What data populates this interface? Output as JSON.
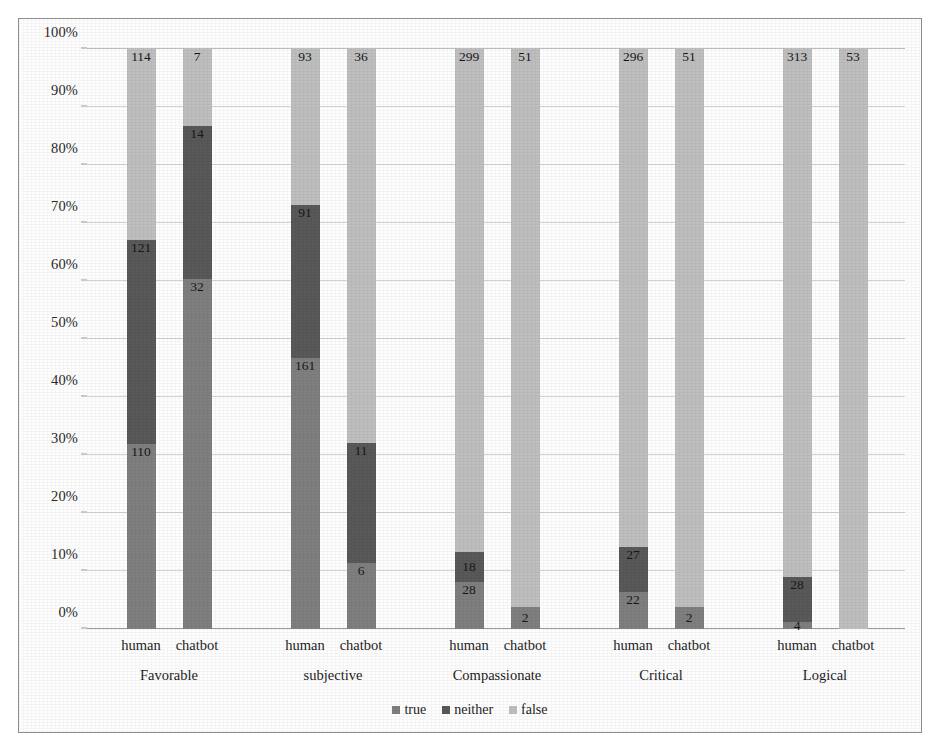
{
  "chart_data": {
    "type": "bar",
    "subtype": "stacked-100-percent",
    "title": "",
    "xlabel": "",
    "ylabel": "",
    "ylim": [
      0,
      100
    ],
    "ytick_labels": [
      "0%",
      "10%",
      "20%",
      "30%",
      "40%",
      "50%",
      "60%",
      "70%",
      "80%",
      "90%",
      "100%"
    ],
    "ytick_values": [
      0,
      10,
      20,
      30,
      40,
      50,
      60,
      70,
      80,
      90,
      100
    ],
    "grid": true,
    "legend_position": "bottom-center",
    "legend": [
      {
        "label": "true",
        "color": "#7f7f7f"
      },
      {
        "label": "neither",
        "color": "#595959"
      },
      {
        "label": "false",
        "color": "#bfbfbf"
      }
    ],
    "categories": [
      "Favorable",
      "subjective",
      "Compassionate",
      "Critical",
      "Logical"
    ],
    "series_labels": [
      "human",
      "chatbot"
    ],
    "bars": [
      {
        "category": "Favorable",
        "series": "human",
        "segments": [
          {
            "name": "true",
            "value": 110,
            "percent": 31.9
          },
          {
            "name": "neither",
            "value": 121,
            "percent": 35.1
          },
          {
            "name": "false",
            "value": 114,
            "percent": 33.0
          }
        ]
      },
      {
        "category": "Favorable",
        "series": "chatbot",
        "segments": [
          {
            "name": "true",
            "value": 32,
            "percent": 60.4
          },
          {
            "name": "neither",
            "value": 14,
            "percent": 26.4
          },
          {
            "name": "false",
            "value": 7,
            "percent": 13.2
          }
        ]
      },
      {
        "category": "subjective",
        "series": "human",
        "segments": [
          {
            "name": "true",
            "value": 161,
            "percent": 46.7
          },
          {
            "name": "neither",
            "value": 91,
            "percent": 26.4
          },
          {
            "name": "false",
            "value": 93,
            "percent": 26.9
          }
        ]
      },
      {
        "category": "subjective",
        "series": "chatbot",
        "segments": [
          {
            "name": "true",
            "value": 6,
            "percent": 11.3
          },
          {
            "name": "neither",
            "value": 11,
            "percent": 20.8
          },
          {
            "name": "false",
            "value": 36,
            "percent": 67.9
          }
        ]
      },
      {
        "category": "Compassionate",
        "series": "human",
        "segments": [
          {
            "name": "true",
            "value": 28,
            "percent": 8.1
          },
          {
            "name": "neither",
            "value": 18,
            "percent": 5.2
          },
          {
            "name": "false",
            "value": 299,
            "percent": 86.7
          }
        ]
      },
      {
        "category": "Compassionate",
        "series": "chatbot",
        "segments": [
          {
            "name": "true",
            "value": 2,
            "percent": 3.8
          },
          {
            "name": "neither",
            "value": 0,
            "percent": 0.0
          },
          {
            "name": "false",
            "value": 51,
            "percent": 96.2
          }
        ]
      },
      {
        "category": "Critical",
        "series": "human",
        "segments": [
          {
            "name": "true",
            "value": 22,
            "percent": 6.4
          },
          {
            "name": "neither",
            "value": 27,
            "percent": 7.8
          },
          {
            "name": "false",
            "value": 296,
            "percent": 85.8
          }
        ]
      },
      {
        "category": "Critical",
        "series": "chatbot",
        "segments": [
          {
            "name": "true",
            "value": 2,
            "percent": 3.8
          },
          {
            "name": "neither",
            "value": 0,
            "percent": 0.0
          },
          {
            "name": "false",
            "value": 51,
            "percent": 96.2
          }
        ]
      },
      {
        "category": "Logical",
        "series": "human",
        "segments": [
          {
            "name": "true",
            "value": 4,
            "percent": 1.2
          },
          {
            "name": "neither",
            "value": 28,
            "percent": 7.7
          },
          {
            "name": "false",
            "value": 313,
            "percent": 91.1
          }
        ]
      },
      {
        "category": "Logical",
        "series": "chatbot",
        "segments": [
          {
            "name": "true",
            "value": 0,
            "percent": 0.0
          },
          {
            "name": "neither",
            "value": 0,
            "percent": 0.0
          },
          {
            "name": "false",
            "value": 53,
            "percent": 100.0
          }
        ]
      }
    ]
  }
}
